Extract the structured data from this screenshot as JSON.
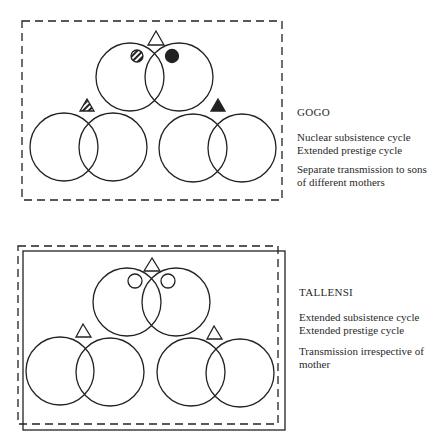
{
  "panels": [
    {
      "title": "GOGO",
      "lines_group1": [
        "Nuclear subsistence cycle",
        "Extended prestige cycle"
      ],
      "lines_group2": [
        "Separate transmission to sons",
        "of different mothers"
      ],
      "border": "dashed",
      "markers": {
        "top": "open-triangle",
        "top_left_circle": "hatched-circle",
        "top_right_circle": "filled-circle",
        "left": "hatched-triangle",
        "right": "filled-triangle"
      }
    },
    {
      "title": "TALLENSI",
      "lines_group1": [
        "Extended subsistence cycle",
        "Extended prestige cycle"
      ],
      "lines_group2": [
        "Transmission irrespective of",
        "mother"
      ],
      "border": "solid-and-dashed",
      "markers": {
        "top": "open-triangle",
        "top_left_circle": "open-circle",
        "top_right_circle": "open-circle",
        "left": "open-triangle",
        "right": "open-triangle"
      }
    }
  ],
  "colors": {
    "stroke": "#222222",
    "background": "#ffffff"
  }
}
